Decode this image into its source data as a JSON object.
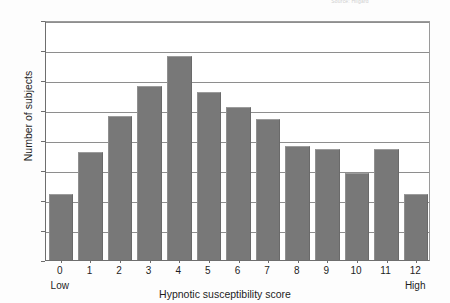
{
  "chart_data": {
    "type": "bar",
    "title": "",
    "xlabel": "Hypnotic susceptibility score",
    "ylabel": "Number of subjects",
    "categories": [
      "0",
      "1",
      "2",
      "3",
      "4",
      "5",
      "6",
      "7",
      "8",
      "9",
      "10",
      "11",
      "12"
    ],
    "values": [
      22,
      36,
      48,
      58,
      68,
      56,
      51,
      47,
      38,
      37,
      29,
      37,
      22
    ],
    "ylim": [
      0,
      80
    ],
    "yticks": [
      "0",
      "10",
      "20",
      "30",
      "40",
      "50",
      "60",
      "70",
      "80"
    ],
    "ytick_values": [
      0,
      10,
      20,
      30,
      40,
      50,
      60,
      70,
      80
    ],
    "grid": true,
    "legend": "none",
    "bar_color": "#787878",
    "axis_color": "#6e6e6e",
    "gridline_color": "#8e8e8e",
    "annotations": {
      "low_label": "Low",
      "high_label": "High",
      "low_at_category": "0",
      "high_at_category": "12"
    }
  },
  "figure": {
    "top_credit": "Source: Hilgard"
  }
}
